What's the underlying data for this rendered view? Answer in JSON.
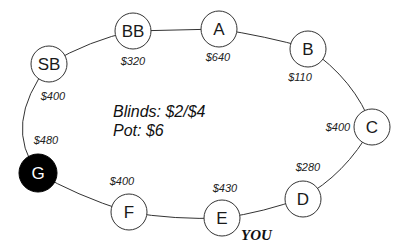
{
  "table": {
    "blinds": "Blinds: $2/$4",
    "pot": "Pot: $6",
    "you_label": "YOU"
  },
  "seats": [
    {
      "name": "SB",
      "stack": "$400",
      "highlighted": false
    },
    {
      "name": "BB",
      "stack": "$320",
      "highlighted": false
    },
    {
      "name": "A",
      "stack": "$640",
      "highlighted": false
    },
    {
      "name": "B",
      "stack": "$110",
      "highlighted": false
    },
    {
      "name": "C",
      "stack": "$400",
      "highlighted": false
    },
    {
      "name": "D",
      "stack": "$280",
      "highlighted": false
    },
    {
      "name": "E",
      "stack": "$430",
      "highlighted": false,
      "is_you": true
    },
    {
      "name": "F",
      "stack": "$400",
      "highlighted": false
    },
    {
      "name": "G",
      "stack": "$480",
      "highlighted": true
    }
  ],
  "colors": {
    "line": "#333333",
    "seat_fill": "#ffffff",
    "highlight_fill": "#000000"
  }
}
